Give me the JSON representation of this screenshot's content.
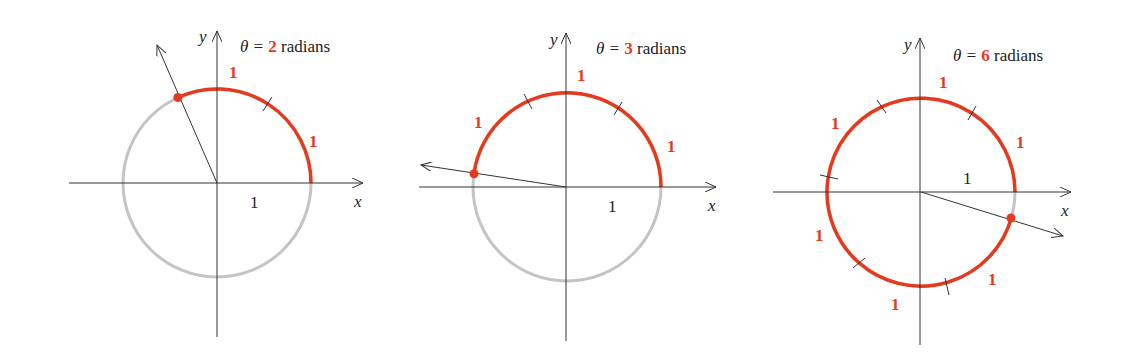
{
  "colors": {
    "arc": "#e63a1e",
    "circle": "#c4c4c4",
    "axis": "#333333"
  },
  "axes": {
    "x_label": "x",
    "y_label": "y",
    "unit_label": "1"
  },
  "panels": [
    {
      "theta_prefix": "θ = ",
      "theta_value": "2",
      "theta_suffix": " radians",
      "arc_labels": [
        "1",
        "1"
      ]
    },
    {
      "theta_prefix": "θ = ",
      "theta_value": "3",
      "theta_suffix": " radians",
      "arc_labels": [
        "1",
        "1",
        "1"
      ]
    },
    {
      "theta_prefix": "θ = ",
      "theta_value": "6",
      "theta_suffix": " radians",
      "arc_labels": [
        "1",
        "1",
        "1",
        "1",
        "1",
        "1"
      ]
    }
  ]
}
